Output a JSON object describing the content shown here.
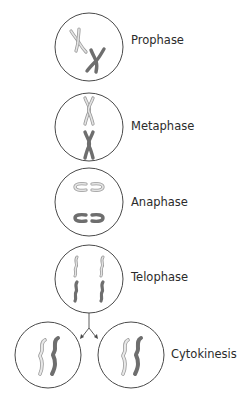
{
  "diagram": {
    "type": "mitosis-stages",
    "stages": [
      {
        "id": "prophase",
        "label": "Prophase"
      },
      {
        "id": "metaphase",
        "label": "Metaphase"
      },
      {
        "id": "anaphase",
        "label": "Anaphase"
      },
      {
        "id": "telophase",
        "label": "Telophase"
      },
      {
        "id": "cytokinesis",
        "label": "Cytokinesis"
      }
    ],
    "colors": {
      "cell_outline": "#4a4a4a",
      "chromosome_light": "#bdbdbd",
      "chromosome_dark": "#6e6e6e",
      "text": "#2b2b2b"
    }
  }
}
